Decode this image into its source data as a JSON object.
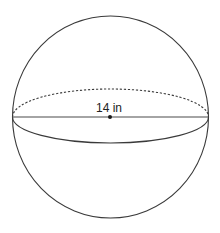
{
  "diagram": {
    "shape": "sphere",
    "dimension": {
      "type": "diameter",
      "value": 14,
      "unit": "in",
      "label": "14 in"
    },
    "features": {
      "great_circle_back": "dashed",
      "great_circle_front": "solid",
      "diameter_segment": "solid",
      "center_point": true
    },
    "colors": {
      "stroke": "#3a3a3a",
      "background": "#ffffff",
      "text": "#222222"
    }
  }
}
